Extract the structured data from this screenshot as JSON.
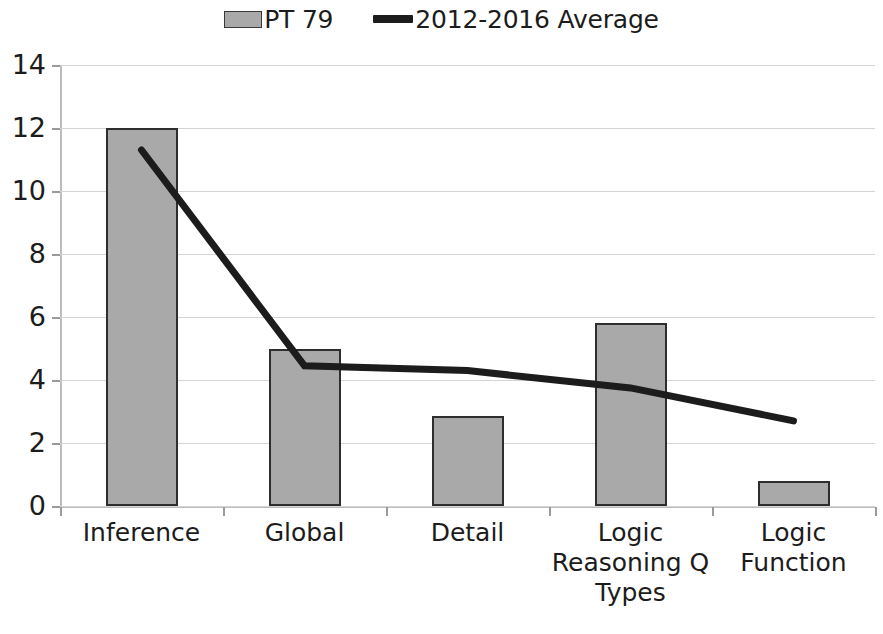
{
  "legend": {
    "entries": [
      {
        "label": "PT 79",
        "marker": "bar-swatch",
        "color": "#a9a9a9"
      },
      {
        "label": "2012-2016 Average",
        "marker": "line-swatch",
        "color": "#1c1c1c"
      }
    ]
  },
  "axis": {
    "y_ticks": [
      "14",
      "12",
      "10",
      "8",
      "6",
      "4",
      "2",
      "0"
    ]
  },
  "chart_data": {
    "type": "bar",
    "title": "",
    "subtitle": "",
    "xlabel": "Logic Reasoning Q Types",
    "ylabel": "",
    "ylim": [
      0,
      14
    ],
    "ytick_values": [
      0,
      2,
      4,
      6,
      8,
      10,
      12,
      14
    ],
    "grid": true,
    "legend_position": "top-center",
    "categories": [
      "Inference",
      "Global",
      "Detail",
      "Logic Reasoning Q Types",
      "Logic Function"
    ],
    "series": [
      {
        "name": "PT 79",
        "type": "bar",
        "color": "#a9a9a9",
        "edge_color": "#2e2e2e",
        "values": [
          12,
          5,
          2.85,
          5.8,
          0.8
        ]
      },
      {
        "name": "2012-2016 Average",
        "type": "line",
        "color": "#1c1c1c",
        "line_width": 7,
        "values": [
          11.3,
          4.45,
          4.3,
          3.75,
          2.7
        ]
      }
    ]
  }
}
